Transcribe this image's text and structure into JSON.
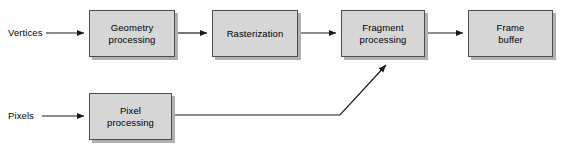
{
  "diagram": {
    "canvas": {
      "width": 565,
      "height": 151
    },
    "colors": {
      "box_fill": "#d6d6d6",
      "box_border": "#4d4d4d",
      "box_shadow": "#b0b0b0",
      "edge": "#1a1a1a",
      "background": "#ffffff",
      "text": "#000000"
    },
    "io_labels": [
      {
        "name": "vertices",
        "text": "Vertices",
        "x": 8,
        "y": 27
      },
      {
        "name": "pixels",
        "text": "Pixels",
        "x": 8,
        "y": 111
      }
    ],
    "nodes": [
      {
        "name": "geometry-processing",
        "label": "Geometry\nprocessing",
        "x": 89,
        "y": 10,
        "w": 86,
        "h": 47
      },
      {
        "name": "rasterization",
        "label": "Rasterization",
        "x": 212,
        "y": 10,
        "w": 86,
        "h": 47
      },
      {
        "name": "fragment-processing",
        "label": "Fragment\nprocessing",
        "x": 341,
        "y": 10,
        "w": 84,
        "h": 47
      },
      {
        "name": "frame-buffer",
        "label": "Frame\nbuffer",
        "x": 468,
        "y": 10,
        "w": 85,
        "h": 47
      },
      {
        "name": "pixel-processing",
        "label": "Pixel\nprocessing",
        "x": 89,
        "y": 93,
        "w": 83,
        "h": 47
      }
    ],
    "edges": [
      {
        "name": "edge-vertices-to-geometry",
        "points": "46,33 86,33",
        "arrow": true
      },
      {
        "name": "edge-geometry-to-rasterization",
        "points": "176,33 209,33",
        "arrow": true
      },
      {
        "name": "edge-rasterization-to-fragment",
        "points": "299,33 338,33",
        "arrow": true
      },
      {
        "name": "edge-fragment-to-framebuffer",
        "points": "426,33 465,33",
        "arrow": true
      },
      {
        "name": "edge-pixels-to-pixelprocessing",
        "points": "42,116 86,116",
        "arrow": true
      },
      {
        "name": "edge-pixelprocessing-to-fragment",
        "points": "173,115 340,115 389,62",
        "arrow": true
      }
    ]
  }
}
